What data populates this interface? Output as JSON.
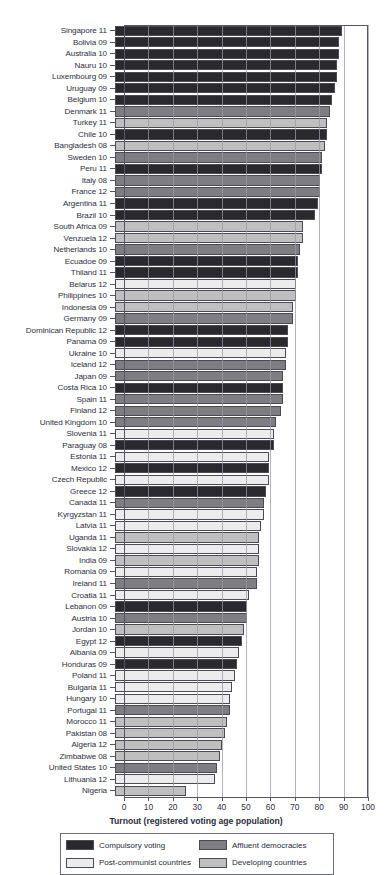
{
  "chart_data": {
    "type": "bar",
    "orientation": "horizontal",
    "title": "",
    "xlabel": "Turnout (registered voting age population)",
    "ylabel": "",
    "xlim": [
      0,
      100
    ],
    "xticks": [
      0,
      10,
      20,
      30,
      40,
      50,
      60,
      70,
      80,
      90,
      100
    ],
    "grid": true,
    "legend_position": "bottom",
    "legend": [
      {
        "key": "compulsory",
        "label": "Compulsory voting",
        "color": "#2a2a2e"
      },
      {
        "key": "affluent",
        "label": "Affluent democracies",
        "color": "#7d7d82"
      },
      {
        "key": "postcommunist",
        "label": "Post-communist countries",
        "color": "#ececec"
      },
      {
        "key": "developing",
        "label": "Developing countries",
        "color": "#bfbfbf"
      }
    ],
    "categories": [
      "Singapore 11",
      "Bolivia 09",
      "Australia 10",
      "Nauru 10",
      "Luxembourg 09",
      "Uruguay 09",
      "Belgium 10",
      "Denmark 11",
      "Turkey 11",
      "Chile 10",
      "Bangladesh 08",
      "Sweden 10",
      "Peru 11",
      "Italy 08",
      "France 12",
      "Argentina 11",
      "Brazil 10",
      "South Africa 09",
      "Venzuela 12",
      "Netherlands 10",
      "Ecuadoe 09",
      "Thiland 11",
      "Belarus 12",
      "Philippines 10",
      "Indonesia 09",
      "Germany 09",
      "Dominican Republic 12",
      "Panama 09",
      "Ukraine 10",
      "Iceland 12",
      "Japan 09",
      "Costa Rica 10",
      "Spain 11",
      "Finland 12",
      "United Kingdom 10",
      "Slovenia 11",
      "Paraguay 08",
      "Estonia 11",
      "Mexico 12",
      "Czech Republic",
      "Greece 12",
      "Canada 11",
      "Kyrgyzstan 11",
      "Latvia 11",
      "Uganda 11",
      "Slovakia 12",
      "India 09",
      "Romania 09",
      "Ireland 11",
      "Croatia 11",
      "Lebanon 09",
      "Austria 10",
      "Jordan 10",
      "Egypt 12",
      "Albania 09",
      "Honduras 09",
      "Poland 11",
      "Bulgaria 11",
      "Hungary 10",
      "Portugal 11",
      "Morocco 11",
      "Pakistan 08",
      "Algeria 12",
      "Zimbabwe 08",
      "United States 10",
      "Lithuania 12",
      "Nigeria"
    ],
    "values": [
      93,
      92,
      92,
      91,
      91,
      90,
      89,
      88,
      87,
      87,
      86,
      85,
      85,
      84,
      84,
      83,
      82,
      77,
      77,
      76,
      75,
      75,
      74,
      74,
      73,
      73,
      71,
      71,
      70,
      70,
      69,
      69,
      69,
      68,
      66,
      65,
      65,
      63,
      63,
      63,
      62,
      61,
      61,
      60,
      59,
      59,
      59,
      58,
      58,
      55,
      54,
      54,
      53,
      52,
      51,
      50,
      49,
      48,
      47,
      47,
      46,
      45,
      44,
      43,
      42,
      41,
      29
    ],
    "category_keys": [
      "compulsory",
      "compulsory",
      "compulsory",
      "compulsory",
      "compulsory",
      "compulsory",
      "compulsory",
      "affluent",
      "developing",
      "compulsory",
      "developing",
      "affluent",
      "compulsory",
      "affluent",
      "affluent",
      "compulsory",
      "compulsory",
      "developing",
      "developing",
      "affluent",
      "compulsory",
      "compulsory",
      "postcommunist",
      "developing",
      "developing",
      "affluent",
      "compulsory",
      "compulsory",
      "postcommunist",
      "affluent",
      "affluent",
      "compulsory",
      "affluent",
      "affluent",
      "affluent",
      "postcommunist",
      "compulsory",
      "postcommunist",
      "compulsory",
      "postcommunist",
      "compulsory",
      "affluent",
      "postcommunist",
      "postcommunist",
      "developing",
      "postcommunist",
      "developing",
      "postcommunist",
      "affluent",
      "postcommunist",
      "compulsory",
      "affluent",
      "developing",
      "compulsory",
      "postcommunist",
      "compulsory",
      "postcommunist",
      "postcommunist",
      "postcommunist",
      "affluent",
      "developing",
      "developing",
      "developing",
      "developing",
      "affluent",
      "postcommunist",
      "developing"
    ]
  }
}
